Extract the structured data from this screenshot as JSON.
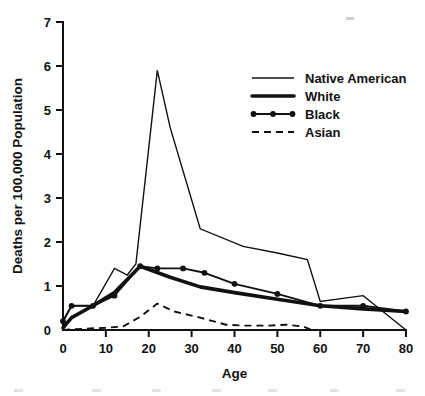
{
  "chart_data": {
    "type": "line",
    "title": "",
    "xlabel": "Age",
    "ylabel": "Deaths per 100,000 Population",
    "xlim": [
      0,
      80
    ],
    "ylim": [
      0,
      7
    ],
    "xticks": [
      0,
      10,
      20,
      30,
      40,
      50,
      60,
      70,
      80
    ],
    "yticks": [
      0,
      1,
      2,
      3,
      4,
      5,
      6,
      7
    ],
    "xtick_labels": [
      "0",
      "10",
      "20",
      "30",
      "40",
      "50",
      "60",
      "70",
      "80"
    ],
    "ytick_labels": [
      "0",
      "1",
      "2",
      "3",
      "4",
      "5",
      "6",
      "7"
    ],
    "grid": false,
    "legend_position": "upper right",
    "series": [
      {
        "name": "Native American",
        "style": "thin-solid",
        "marker": "none",
        "x": [
          0,
          2,
          7,
          12,
          15,
          17,
          22,
          25,
          32,
          42,
          50,
          57,
          60,
          70,
          80
        ],
        "y": [
          0.2,
          0.55,
          0.55,
          1.4,
          1.25,
          1.5,
          5.9,
          4.6,
          2.3,
          1.9,
          1.75,
          1.6,
          0.65,
          0.78,
          0.0
        ]
      },
      {
        "name": "White",
        "style": "thick-solid",
        "marker": "none",
        "x": [
          0,
          2,
          7,
          12,
          18,
          25,
          32,
          40,
          50,
          60,
          70,
          80
        ],
        "y": [
          0.05,
          0.28,
          0.55,
          0.85,
          1.45,
          1.2,
          0.98,
          0.85,
          0.7,
          0.55,
          0.48,
          0.42
        ]
      },
      {
        "name": "Black",
        "style": "solid-with-dots",
        "marker": "filled-circle",
        "x": [
          0,
          2,
          7,
          12,
          18,
          22,
          28,
          33,
          40,
          50,
          60,
          70,
          80
        ],
        "y": [
          0.2,
          0.55,
          0.55,
          0.78,
          1.45,
          1.4,
          1.4,
          1.3,
          1.05,
          0.82,
          0.55,
          0.55,
          0.42
        ]
      },
      {
        "name": "Asian",
        "style": "dashed",
        "marker": "none",
        "x": [
          0,
          5,
          10,
          14,
          18,
          22,
          26,
          32,
          38,
          42,
          48,
          52,
          56,
          58,
          80
        ],
        "y": [
          0.0,
          0.03,
          0.05,
          0.08,
          0.3,
          0.6,
          0.42,
          0.28,
          0.12,
          0.1,
          0.1,
          0.12,
          0.08,
          0.0,
          0.0
        ]
      }
    ],
    "legend_entries": [
      {
        "label": "Native American",
        "style": "thin-solid"
      },
      {
        "label": "White",
        "style": "thick-solid"
      },
      {
        "label": "Black",
        "style": "solid-with-dots"
      },
      {
        "label": "Asian",
        "style": "dashed"
      }
    ]
  }
}
